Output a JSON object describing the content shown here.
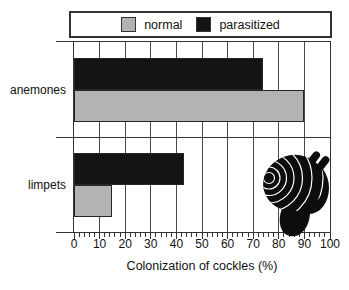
{
  "chart_data": {
    "type": "bar",
    "orientation": "horizontal",
    "categories": [
      "anemones",
      "limpets"
    ],
    "series": [
      {
        "name": "normal",
        "color": "#b3b3b3",
        "values": [
          90,
          15
        ]
      },
      {
        "name": "parasitized",
        "color": "#141414",
        "values": [
          74,
          43
        ]
      }
    ],
    "xlabel": "Colonization of cockles (%)",
    "xlim": [
      0,
      100
    ],
    "xticks": [
      0,
      10,
      20,
      30,
      40,
      50,
      60,
      70,
      80,
      90,
      100
    ],
    "minor_tick_step": 2,
    "grid": true,
    "legend_position": "top",
    "annotation": "black cockle silhouette drawn inside plot at lower right"
  },
  "legend": {
    "items": [
      {
        "label": "normal",
        "color": "#b3b3b3"
      },
      {
        "label": "parasitized",
        "color": "#141414"
      }
    ]
  },
  "axis": {
    "title": "Colonization of cockles (%)",
    "tick_labels": [
      "0",
      "10",
      "20",
      "30",
      "40",
      "50",
      "60",
      "70",
      "80",
      "90",
      "100"
    ]
  },
  "illustration": {
    "name": "cockle",
    "description": "black cockle shell silhouette with white growth lines, foot and two siphons"
  },
  "colors": {
    "background": "#ffffff",
    "frame": "#333333",
    "grid": "#4a4a4a",
    "text": "#111111",
    "bar_outline": "#262626"
  }
}
